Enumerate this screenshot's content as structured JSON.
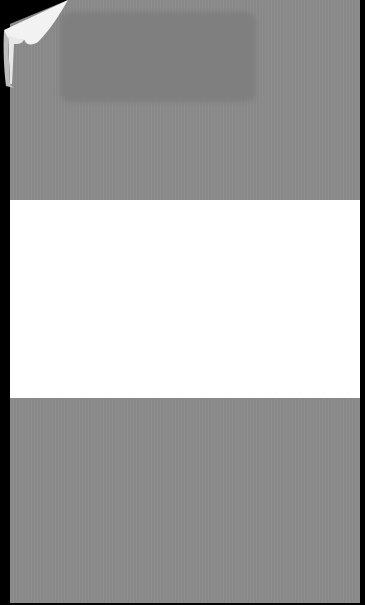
{
  "scene": {
    "description": "Photograph of a gray sheet with a horizontal white band and a curled top-left corner on a black background",
    "background_color": "#000000"
  },
  "paper": {
    "colors": {
      "gray": "#8b8b8b",
      "gray_dark_patch": "#7f7f7f",
      "white_band": "#ffffff",
      "curl_highlight": "#f2f2f2",
      "curl_shadow": "#bdbdbd"
    },
    "sections": [
      {
        "name": "top-gray",
        "color": "#8b8b8b"
      },
      {
        "name": "middle-white",
        "color": "#ffffff"
      },
      {
        "name": "bottom-gray",
        "color": "#8b8b8b"
      }
    ]
  }
}
